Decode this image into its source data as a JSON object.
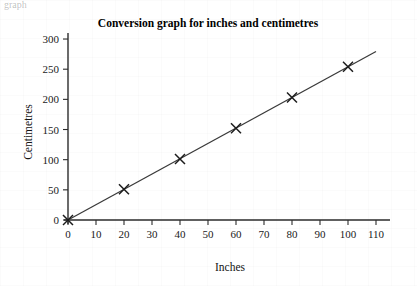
{
  "page": {
    "background_color": "#ffffff",
    "clipped_top_text": "graph"
  },
  "chart_data": {
    "type": "line",
    "title": "Conversion graph for inches and centimetres",
    "xlabel": "Inches",
    "ylabel": "Centimetres",
    "xlim": [
      0,
      115
    ],
    "ylim": [
      0,
      310
    ],
    "xticks": [
      0,
      10,
      20,
      30,
      40,
      50,
      60,
      70,
      80,
      90,
      100,
      110
    ],
    "yticks": [
      0,
      50,
      100,
      150,
      200,
      250,
      300
    ],
    "xtick_labels": [
      "0",
      "10",
      "20",
      "30",
      "40",
      "50",
      "60",
      "70",
      "80",
      "90",
      "100",
      "110"
    ],
    "ytick_labels": [
      "0",
      "50",
      "100",
      "150",
      "200",
      "250",
      "300"
    ],
    "grid": false,
    "legend": false,
    "marker": "x",
    "line_color": "#3a3a3a",
    "marker_color": "#1c1c1c",
    "axis_color": "#2b2b2b",
    "line_extent_x": [
      0,
      110
    ],
    "series": [
      {
        "name": "inches to centimetres",
        "x": [
          0,
          20,
          40,
          60,
          80,
          100
        ],
        "values": [
          0,
          51,
          101,
          152,
          203,
          254
        ]
      }
    ]
  }
}
